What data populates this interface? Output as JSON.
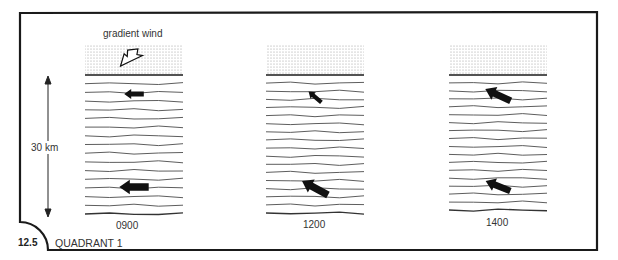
{
  "figure": {
    "number": "12.5",
    "caption": "QUADRANT 1",
    "gradient_label": "gradient wind",
    "height_label": "30 km"
  },
  "panels": [
    {
      "time": "0900",
      "x": 85,
      "lines": 16,
      "arrows": [
        {
          "y": 94,
          "angle": 0,
          "size": 0.7
        },
        {
          "y": 187,
          "angle": 0,
          "size": 1.05
        }
      ],
      "gradient_arrow": true
    },
    {
      "time": "1200",
      "x": 266,
      "lines": 17,
      "arrows": [
        {
          "y": 97,
          "angle": 40,
          "size": 0.6
        },
        {
          "y": 188,
          "angle": 28,
          "size": 1.05
        }
      ],
      "gradient_arrow": false
    },
    {
      "time": "1400",
      "x": 449,
      "lines": 17,
      "arrows": [
        {
          "y": 95,
          "angle": 25,
          "size": 1.0
        },
        {
          "y": 186,
          "angle": 22,
          "size": 0.95
        }
      ],
      "gradient_arrow": false
    }
  ],
  "colors": {
    "ink": "#1a1a1a",
    "line": "#333333",
    "stipple": "#bdbdbd"
  }
}
